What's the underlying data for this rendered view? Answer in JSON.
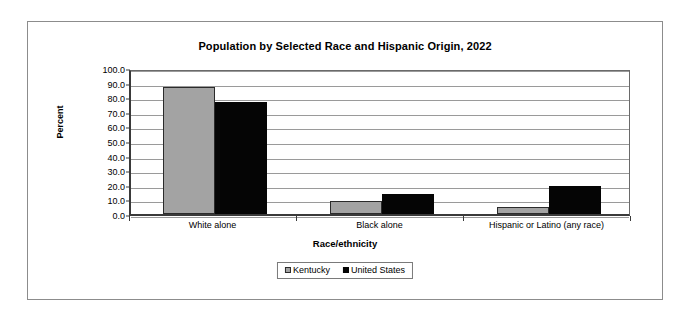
{
  "chart_data": {
    "type": "bar",
    "title": "Population by Selected Race and Hispanic Origin, 2022",
    "xlabel": "Race/ethnicity",
    "ylabel": "Percent",
    "categories": [
      "White alone",
      "Black alone",
      "Hispanic or Latino (any race)"
    ],
    "series": [
      {
        "name": "Kentucky",
        "color": "#a3a3a3",
        "values": [
          86.9,
          9.0,
          4.9
        ]
      },
      {
        "name": "United States",
        "color": "#050505",
        "values": [
          76.5,
          13.7,
          19.1
        ]
      }
    ],
    "ylim": [
      0,
      100
    ],
    "ytick_labels": [
      "100.0",
      "90.0",
      "80.0",
      "70.0",
      "60.0",
      "50.0",
      "40.0",
      "30.0",
      "20.0",
      "10.0",
      "0.0"
    ],
    "ytick_values": [
      100,
      90,
      80,
      70,
      60,
      50,
      40,
      30,
      20,
      10,
      0
    ],
    "grid": true,
    "legend_position": "bottom"
  }
}
